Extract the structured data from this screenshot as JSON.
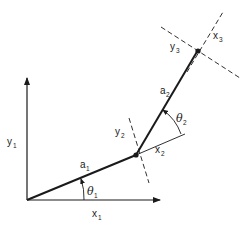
{
  "diagram": {
    "title": "",
    "type": "two-link planar manipulator frames",
    "colors": {
      "stroke": "#1a1a1a",
      "background": "#ffffff"
    },
    "labels": {
      "y1": {
        "base": "y",
        "sub": "1"
      },
      "x1": {
        "base": "x",
        "sub": "1"
      },
      "a1": {
        "base": "a",
        "sub": "1"
      },
      "theta1": {
        "base": "θ",
        "sub": "1"
      },
      "y2": {
        "base": "y",
        "sub": "2"
      },
      "x2": {
        "base": "x",
        "sub": "2"
      },
      "a2": {
        "base": "a",
        "sub": "2"
      },
      "theta2": {
        "base": "θ",
        "sub": "2"
      },
      "y3": {
        "base": "y",
        "sub": "3"
      },
      "x3": {
        "base": "x",
        "sub": "3"
      }
    },
    "points": {
      "origin": [
        27,
        200
      ],
      "joint1": [
        136,
        155
      ],
      "joint2": [
        198,
        50
      ]
    }
  }
}
